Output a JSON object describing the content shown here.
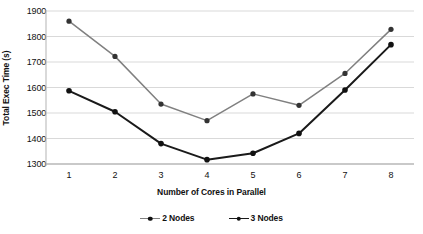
{
  "chart_data": {
    "type": "line",
    "title": "",
    "xlabel": "Number of Cores in Parallel",
    "ylabel": "Total Exec Time (s)",
    "categories": [
      "1",
      "2",
      "3",
      "4",
      "5",
      "6",
      "7",
      "8"
    ],
    "x": [
      1,
      2,
      3,
      4,
      5,
      6,
      7,
      8
    ],
    "series": [
      {
        "name": "2 Nodes",
        "color": "#808080",
        "marker": "circle",
        "values": [
          1860,
          1722,
          1535,
          1470,
          1575,
          1530,
          1655,
          1828
        ]
      },
      {
        "name": "3 Nodes",
        "color": "#1a1a1a",
        "marker": "circle",
        "values": [
          1587,
          1505,
          1380,
          1317,
          1342,
          1420,
          1590,
          1768
        ]
      }
    ],
    "ylim": [
      1300,
      1900
    ],
    "yticks": [
      1300,
      1400,
      1500,
      1600,
      1700,
      1800,
      1900
    ],
    "ytick_labels": [
      "1300",
      "1400",
      "1500",
      "1600",
      "1700",
      "1800",
      "1900"
    ],
    "xlim": [
      0.5,
      8.5
    ],
    "grid": "horizontal",
    "gridcolor": "#d9d9d9",
    "legend_position": "bottom",
    "legend": [
      "2 Nodes",
      "3 Nodes"
    ],
    "background": "#ffffff"
  }
}
